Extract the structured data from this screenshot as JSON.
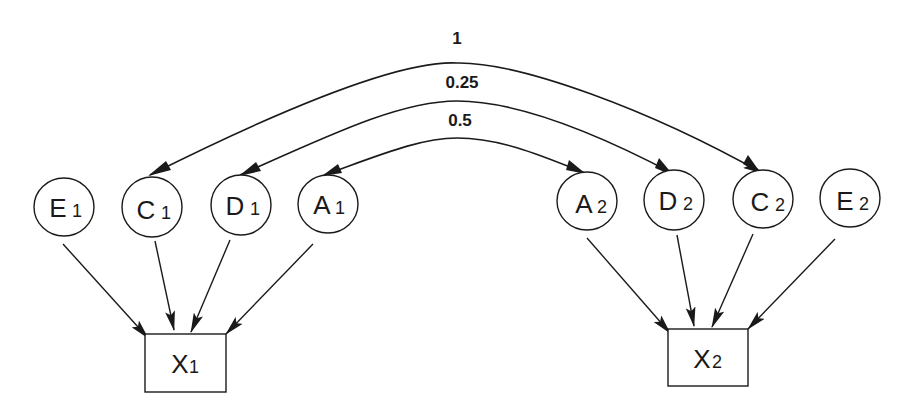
{
  "diagram": {
    "type": "path-diagram",
    "left_nodes": [
      {
        "id": "E1",
        "letter": "E",
        "sub": "1",
        "cx": 64,
        "cy": 207
      },
      {
        "id": "C1",
        "letter": "C",
        "sub": "1",
        "cx": 152,
        "cy": 207
      },
      {
        "id": "D1",
        "letter": "D",
        "sub": "1",
        "cx": 241,
        "cy": 205
      },
      {
        "id": "A1",
        "letter": "A",
        "sub": "1",
        "cx": 328,
        "cy": 204
      }
    ],
    "right_nodes": [
      {
        "id": "A2",
        "letter": "A",
        "sub": "2",
        "cx": 587,
        "cy": 201
      },
      {
        "id": "D2",
        "letter": "D",
        "sub": "2",
        "cx": 674,
        "cy": 200
      },
      {
        "id": "C2",
        "letter": "C",
        "sub": "2",
        "cx": 763,
        "cy": 199
      },
      {
        "id": "E2",
        "letter": "E",
        "sub": "2",
        "cx": 850,
        "cy": 198
      }
    ],
    "observed": [
      {
        "id": "X1",
        "letter": "X",
        "sub": "1"
      },
      {
        "id": "X2",
        "letter": "X",
        "sub": "2"
      }
    ],
    "correlations": [
      {
        "from": "C1",
        "to": "C2",
        "label": "1"
      },
      {
        "from": "D1",
        "to": "D2",
        "label": "0.25"
      },
      {
        "from": "A1",
        "to": "A2",
        "label": "0.5"
      }
    ],
    "paths": [
      {
        "from": "E1",
        "to": "X1"
      },
      {
        "from": "C1",
        "to": "X1"
      },
      {
        "from": "D1",
        "to": "X1"
      },
      {
        "from": "A1",
        "to": "X1"
      },
      {
        "from": "A2",
        "to": "X2"
      },
      {
        "from": "D2",
        "to": "X2"
      },
      {
        "from": "C2",
        "to": "X2"
      },
      {
        "from": "E2",
        "to": "X2"
      }
    ]
  }
}
